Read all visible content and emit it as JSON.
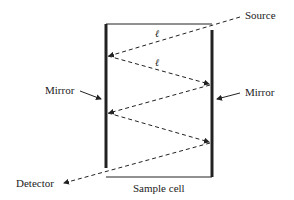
{
  "diagram": {
    "type": "multipass-cell",
    "labels": {
      "source": "Source",
      "mirror_left": "Mirror",
      "mirror_right": "Mirror",
      "detector": "Detector",
      "sample_cell": "Sample cell",
      "path_length_1": "ℓ",
      "path_length_2": "ℓ"
    },
    "beam_path": [
      {
        "from": "Source",
        "to": "left mirror"
      },
      {
        "from": "left mirror",
        "to": "right mirror"
      },
      {
        "from": "right mirror",
        "to": "left mirror"
      },
      {
        "from": "left mirror",
        "to": "right mirror"
      },
      {
        "from": "right mirror",
        "to": "Detector"
      }
    ]
  }
}
